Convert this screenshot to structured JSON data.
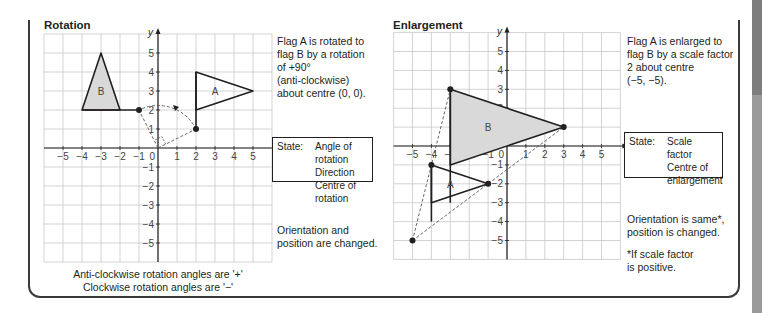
{
  "rotation": {
    "title": "Rotation",
    "description": "Flag A is rotated to\nflag B by a rotation\nof +90°\n(anti-clockwise)\nabout centre (0, 0).",
    "state_label": "State:",
    "state_items": [
      "Angle of rotation",
      "Direction",
      "Centre of rotation"
    ],
    "note": "Orientation and\nposition are changed.",
    "caption_line1": "Anti-clockwise rotation angles are '+'",
    "caption_line2": "Clockwise rotation angles are '−'",
    "flag_a_label": "A",
    "flag_b_label": "B",
    "axis_x_label": "x",
    "axis_y_label": "y"
  },
  "enlargement": {
    "title": "Enlargement",
    "description": "Flag A is enlarged to\nflag B by a scale factor\n2 about centre\n(−5, −5).",
    "state_label": "State:",
    "state_items": [
      "Scale factor",
      "Centre of",
      "enlargement"
    ],
    "note": "Orientation is same*,\nposition is changed.",
    "footnote": "*If scale factor\nis positive.",
    "flag_a_label": "A",
    "flag_b_label": "B",
    "axis_x_label": "x",
    "axis_y_label": "y"
  },
  "chart_data": [
    {
      "type": "scatter",
      "title": "Rotation",
      "xlabel": "x",
      "ylabel": "y",
      "xlim": [
        -6,
        6
      ],
      "ylim": [
        -6,
        6
      ],
      "x_ticks": [
        -5,
        -4,
        -3,
        -2,
        -1,
        0,
        1,
        2,
        3,
        4,
        5
      ],
      "y_ticks": [
        -5,
        -4,
        -3,
        -2,
        -1,
        1,
        2,
        3,
        4,
        5
      ],
      "grid": true,
      "series": [
        {
          "name": "Flag A",
          "points": [
            [
              2,
              1
            ],
            [
              2,
              2
            ],
            [
              2,
              4
            ],
            [
              5,
              3
            ],
            [
              2,
              2
            ]
          ],
          "fill": "none",
          "pole": [
            [
              2,
              1
            ],
            [
              2,
              4
            ]
          ],
          "triangle": [
            [
              2,
              2
            ],
            [
              2,
              4
            ],
            [
              5,
              3
            ]
          ]
        },
        {
          "name": "Flag B",
          "points": [
            [
              -1,
              2
            ],
            [
              -2,
              2
            ],
            [
              -4,
              2
            ],
            [
              -3,
              5
            ]
          ],
          "fill": "#d9d9d9",
          "pole": [
            [
              -1,
              2
            ],
            [
              -4,
              2
            ]
          ],
          "triangle": [
            [
              -2,
              2
            ],
            [
              -4,
              2
            ],
            [
              -3,
              5
            ]
          ]
        }
      ],
      "annotations": [
        "centre (0,0)",
        "dashed rotation arc from (2,1) to (-1,2)",
        "right angle marker at origin"
      ]
    },
    {
      "type": "scatter",
      "title": "Enlargement",
      "xlabel": "x",
      "ylabel": "y",
      "xlim": [
        -6,
        6
      ],
      "ylim": [
        -6,
        6
      ],
      "x_ticks": [
        -5,
        -4,
        -3,
        -2,
        -1,
        0,
        1,
        2,
        3,
        4,
        5
      ],
      "y_ticks": [
        -5,
        -4,
        -3,
        -2,
        -1,
        1,
        2,
        3,
        4,
        5
      ],
      "grid": true,
      "series": [
        {
          "name": "Flag A",
          "pole": [
            [
              -4,
              -1
            ],
            [
              -4,
              -4
            ]
          ],
          "triangle": [
            [
              -4,
              -1
            ],
            [
              -1,
              -2
            ],
            [
              -4,
              -3
            ]
          ],
          "fill": "none"
        },
        {
          "name": "Flag B",
          "pole": [
            [
              -3,
              3
            ],
            [
              -3,
              -3
            ]
          ],
          "triangle": [
            [
              -3,
              3
            ],
            [
              3,
              1
            ],
            [
              -3,
              -1
            ]
          ],
          "fill": "#d9d9d9"
        }
      ],
      "centre": [
        -5,
        -5
      ],
      "scale_factor": 2,
      "annotations": [
        "dashed rays from (-5,-5) through (-4,-1) to (-3,3)",
        "dashed rays from (-5,-5) through (-1,-2) to (3,1)"
      ]
    }
  ]
}
